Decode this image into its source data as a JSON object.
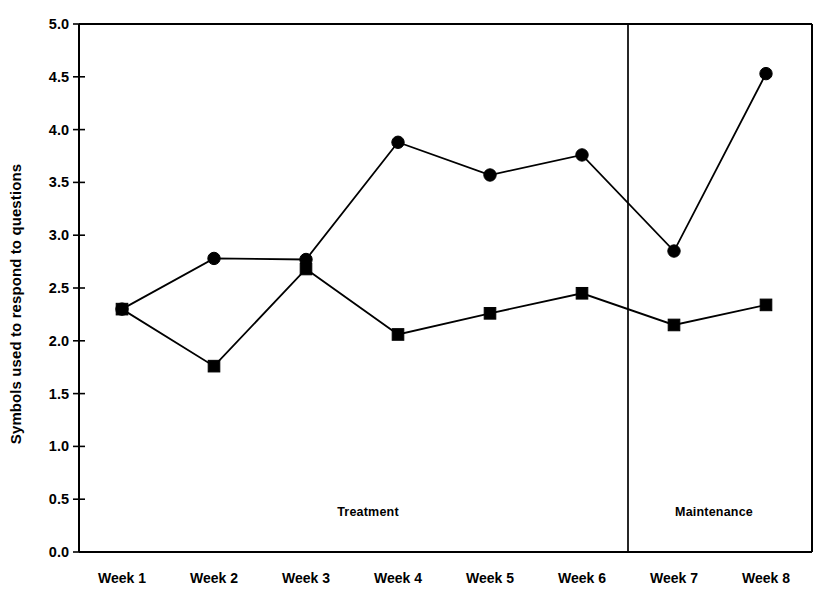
{
  "chart_data": {
    "type": "line",
    "title": "",
    "subtitle": "",
    "xlabel": "",
    "ylabel": "Symbols used to respond to questions",
    "categories": [
      "Week 1",
      "Week 2",
      "Week 3",
      "Week 4",
      "Week 5",
      "Week 6",
      "Week 7",
      "Week 8"
    ],
    "ylim": [
      0.0,
      5.0
    ],
    "ytick_labels": [
      "0.0",
      "0.5",
      "1.0",
      "1.5",
      "2.0",
      "2.5",
      "3.0",
      "3.5",
      "4.0",
      "4.5",
      "5.0"
    ],
    "ytick_values": [
      0.0,
      0.5,
      1.0,
      1.5,
      2.0,
      2.5,
      3.0,
      3.5,
      4.0,
      4.5,
      5.0
    ],
    "grid": false,
    "legend": null,
    "series": [
      {
        "name": "circle-series",
        "marker": "circle",
        "color": "#000000",
        "values": [
          2.3,
          2.78,
          2.77,
          3.88,
          3.57,
          3.76,
          2.85,
          4.53
        ]
      },
      {
        "name": "square-series",
        "marker": "square",
        "color": "#000000",
        "values": [
          2.3,
          1.76,
          2.68,
          2.06,
          2.26,
          2.45,
          2.15,
          2.34
        ]
      }
    ],
    "annotations": [
      {
        "text": "Treatment",
        "x_category_center": "Week 3.5",
        "phase": "treatment"
      },
      {
        "text": "Maintenance",
        "x_category_center": "Week 7.5",
        "phase": "maintenance"
      }
    ],
    "phase_divider": {
      "between": [
        "Week 6",
        "Week 7"
      ],
      "style": "vertical-line"
    }
  }
}
